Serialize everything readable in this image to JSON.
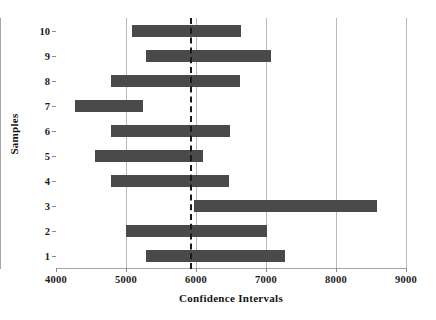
{
  "chart_data": {
    "type": "bar",
    "orientation": "horizontal",
    "title": "",
    "xlabel": "Confidence Intervals",
    "ylabel": "Samples",
    "xlim": [
      4000,
      9000
    ],
    "xticks": [
      4000,
      5000,
      6000,
      7000,
      8000,
      9000
    ],
    "xtick_labels": [
      "4000",
      "5000",
      "6000",
      "7000",
      "8000",
      "9000"
    ],
    "categories": [
      "1",
      "2",
      "3",
      "4",
      "5",
      "6",
      "7",
      "8",
      "9",
      "10"
    ],
    "ytick_labels": [
      "1",
      "2",
      "3",
      "4",
      "5",
      "6",
      "7",
      "8",
      "9",
      "10"
    ],
    "grid": "vertical-only",
    "legend": "none",
    "reference_line": {
      "value": 5914,
      "style": "dashed",
      "color": "#1a1a1a"
    },
    "bar_color": "#4a4a4a",
    "intervals": [
      {
        "sample": "1",
        "lower": 5290,
        "upper": 7270
      },
      {
        "sample": "2",
        "lower": 5000,
        "upper": 7010
      },
      {
        "sample": "3",
        "lower": 5970,
        "upper": 8590
      },
      {
        "sample": "4",
        "lower": 4790,
        "upper": 6470
      },
      {
        "sample": "5",
        "lower": 4560,
        "upper": 6110
      },
      {
        "sample": "6",
        "lower": 4790,
        "upper": 6490
      },
      {
        "sample": "7",
        "lower": 4270,
        "upper": 5240
      },
      {
        "sample": "8",
        "lower": 4790,
        "upper": 6630
      },
      {
        "sample": "9",
        "lower": 5290,
        "upper": 7070
      },
      {
        "sample": "10",
        "lower": 5090,
        "upper": 6640
      }
    ]
  }
}
